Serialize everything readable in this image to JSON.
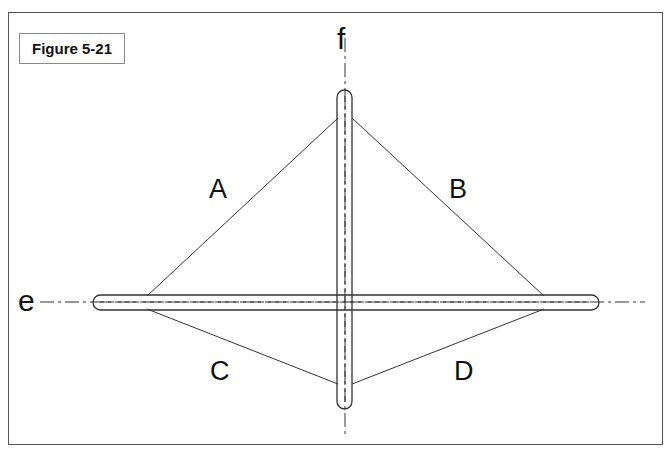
{
  "figure": {
    "title": "Figure 5-21"
  },
  "axes": {
    "horizontal_label": "e",
    "vertical_label": "f"
  },
  "segments": {
    "upper_left": "A",
    "upper_right": "B",
    "lower_left": "C",
    "lower_right": "D"
  },
  "colors": {
    "line": "#333333",
    "frame": "#555555",
    "background": "#ffffff"
  }
}
